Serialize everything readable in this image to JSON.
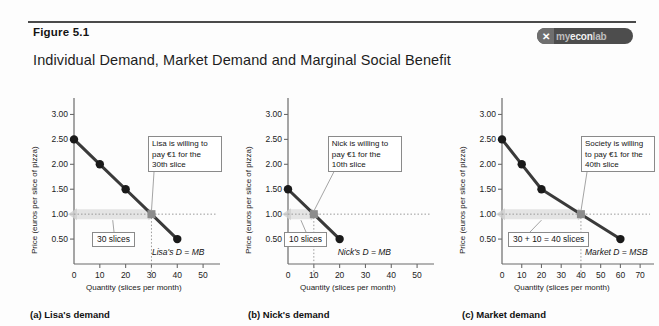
{
  "figure": {
    "number_label": "Figure 5.1",
    "title": "Individual Demand, Market Demand and Marginal Social Benefit",
    "logo": {
      "mark": "✕",
      "word_dim": "my",
      "word_bright": "econ",
      "word_tail": "lab",
      "full_text": "myeconlab"
    }
  },
  "chart_data": [
    {
      "type": "line",
      "id": "panel-a",
      "title": "(a) Lisa's demand",
      "xlabel": "Quantity (slices per month)",
      "ylabel": "Price (euros per slice of pizza)",
      "xlim": [
        0,
        55
      ],
      "ylim": [
        0,
        3.25
      ],
      "xticks": [
        0,
        10,
        20,
        30,
        40,
        50
      ],
      "yticks": [
        "0.50",
        "1.00",
        "1.50",
        "2.00",
        "2.50",
        "3.00"
      ],
      "ytick_values": [
        0.5,
        1.0,
        1.5,
        2.0,
        2.5,
        3.0
      ],
      "grid": false,
      "series": [
        {
          "name": "Lisa's D = MB",
          "x": [
            0,
            10,
            20,
            30,
            40
          ],
          "values": [
            2.5,
            2.0,
            1.5,
            1.0,
            0.5
          ]
        }
      ],
      "highlight_point": {
        "x": 30,
        "y": 1.0
      },
      "curve_label": "Lisa's D = MB",
      "callout": "Lisa is willing to pay €1 for the 30th slice",
      "quantity_tag": "30 slices"
    },
    {
      "type": "line",
      "id": "panel-b",
      "title": "(b) Nick's demand",
      "xlabel": "Quantity (slices per month)",
      "ylabel": "Price (euros per slice of pizza)",
      "xlim": [
        0,
        55
      ],
      "ylim": [
        0,
        3.25
      ],
      "xticks": [
        0,
        10,
        20,
        30,
        40,
        50
      ],
      "yticks": [
        "0.50",
        "1.00",
        "1.50",
        "2.00",
        "2.50",
        "3.00"
      ],
      "ytick_values": [
        0.5,
        1.0,
        1.5,
        2.0,
        2.5,
        3.0
      ],
      "grid": false,
      "series": [
        {
          "name": "Nick's D = MB",
          "x": [
            0,
            10,
            20
          ],
          "values": [
            1.5,
            1.0,
            0.5
          ]
        }
      ],
      "highlight_point": {
        "x": 10,
        "y": 1.0
      },
      "curve_label": "Nick's D = MB",
      "callout": "Nick is willing to pay €1 for the 10th slice",
      "quantity_tag": "10 slices"
    },
    {
      "type": "line",
      "id": "panel-c",
      "title": "(c) Market demand",
      "xlabel": "Quantity (slices per month)",
      "ylabel": "Price (euros per slice of pizza)",
      "xlim": [
        0,
        75
      ],
      "ylim": [
        0,
        3.25
      ],
      "xticks": [
        0,
        10,
        20,
        30,
        40,
        50,
        60,
        70
      ],
      "yticks": [
        "0.50",
        "1.00",
        "1.50",
        "2.00",
        "2.50",
        "3.00"
      ],
      "ytick_values": [
        0.5,
        1.0,
        1.5,
        2.0,
        2.5,
        3.0
      ],
      "grid": false,
      "series": [
        {
          "name": "Market D = MSB",
          "x": [
            0,
            10,
            20,
            40,
            60
          ],
          "values": [
            2.5,
            2.0,
            1.5,
            1.0,
            0.5
          ]
        }
      ],
      "highlight_point": {
        "x": 40,
        "y": 1.0
      },
      "curve_label": "Market D = MSB",
      "callout": "Society is willing to pay €1 for the 40th slice",
      "quantity_tag": "30 + 10 = 40 slices"
    }
  ],
  "colors": {
    "curve": "#3a3a3a",
    "axis": "#6b6b6b",
    "marker": "#1a1a1a",
    "highlight_marker": "#8c8c8c",
    "arrow_band": "#cfcfcf",
    "badge_bg": "#4d4d4d",
    "text": "#1a1a1a"
  }
}
